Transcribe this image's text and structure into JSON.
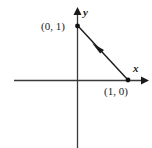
{
  "figure": {
    "type": "coordinate-plane-diagram",
    "background_color": "#ffffff",
    "axis_color": "#3a3a3a",
    "line_color": "#1a1a1a",
    "text_color": "#1a1a1a",
    "axis_labels": {
      "x": "x",
      "y": "y"
    },
    "points": [
      {
        "name": "point-0-1",
        "label": "(0, 1)",
        "coordinates": [
          0,
          1
        ],
        "pixel": [
          77,
          26
        ],
        "label_pixel": [
          43,
          30
        ]
      },
      {
        "name": "point-1-0",
        "label": "(1, 0)",
        "coordinates": [
          1,
          0
        ],
        "pixel": [
          128,
          80
        ],
        "label_pixel": [
          105,
          95
        ]
      }
    ],
    "segment": {
      "name": "vector-segment",
      "from": [
        1,
        0
      ],
      "to": [
        0,
        1
      ],
      "from_pixel": [
        128,
        80
      ],
      "to_pixel": [
        77,
        26
      ],
      "direction": "toward (0, 1)",
      "arrowhead_pixel": [
        97,
        48
      ]
    },
    "axes": {
      "x_axis": {
        "start_pixel": [
          14,
          80
        ],
        "end_pixel": [
          148,
          80
        ],
        "arrow": "right"
      },
      "y_axis": {
        "start_pixel": [
          77,
          148
        ],
        "end_pixel": [
          77,
          8
        ],
        "arrow": "up"
      }
    }
  }
}
